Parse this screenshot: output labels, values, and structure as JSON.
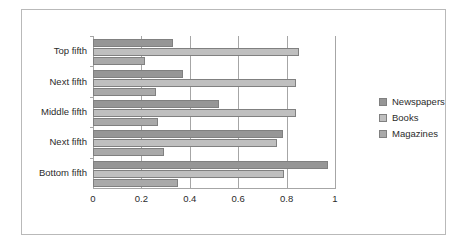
{
  "chart_data": {
    "type": "bar",
    "orientation": "horizontal",
    "title": "",
    "subtitle": "",
    "xlabel": "",
    "ylabel": "",
    "xlim": [
      0,
      1
    ],
    "xticks": [
      "0",
      "0.2",
      "0.4",
      "0.6",
      "0.8",
      "1"
    ],
    "xtick_values": [
      0,
      0.2,
      0.4,
      0.6,
      0.8,
      1
    ],
    "grid": "vertical",
    "legend_position": "right",
    "categories": [
      "Top fifth",
      "Next fifth",
      "Middle fifth",
      "Next fifth",
      "Bottom fifth"
    ],
    "series": [
      {
        "name": "Newspapers",
        "color": "#969696",
        "values": [
          0.33,
          0.37,
          0.52,
          0.785,
          0.97
        ]
      },
      {
        "name": "Books",
        "color": "#bfbfbf",
        "values": [
          0.85,
          0.84,
          0.84,
          0.76,
          0.79
        ]
      },
      {
        "name": "Magazines",
        "color": "#a9a9a9",
        "values": [
          0.215,
          0.26,
          0.27,
          0.295,
          0.35
        ]
      }
    ]
  },
  "legend": {
    "items": [
      {
        "label": "Newspapers",
        "swatch": "newspapers"
      },
      {
        "label": "Books",
        "swatch": "books"
      },
      {
        "label": "Magazines",
        "swatch": "magazines"
      }
    ]
  }
}
